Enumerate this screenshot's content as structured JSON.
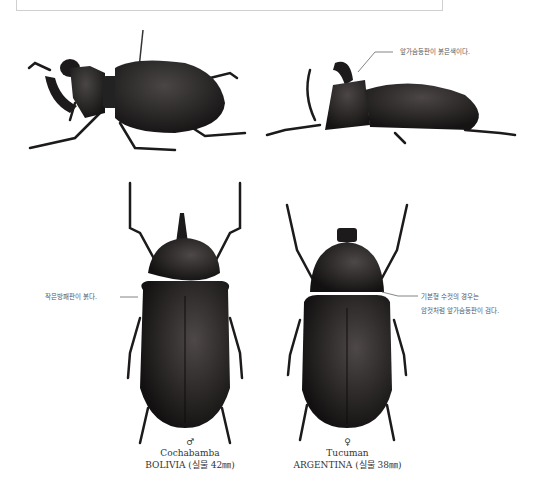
{
  "page": {
    "annotations": {
      "side_view": "앞가슴등판이 붉은색이다.",
      "male_top": "작은방패판이 붉다.",
      "female_top_line1": "기본형 수컷의 경우는",
      "female_top_line2": "암컷처럼 앞가슴등판이 검다."
    },
    "specimens": [
      {
        "sex_symbol": "♂",
        "locality": "Cochabamba",
        "country_size": "BOLIVIA (실물 42㎜)"
      },
      {
        "sex_symbol": "♀",
        "locality": "Tucuman",
        "country_size": "ARGENTINA (실물 38㎜)"
      }
    ],
    "colors": {
      "beetle_body": "#1c1a1a",
      "beetle_highlight": "#4a4646",
      "frame_border": "#cfcfcf",
      "text": "#555555"
    }
  }
}
